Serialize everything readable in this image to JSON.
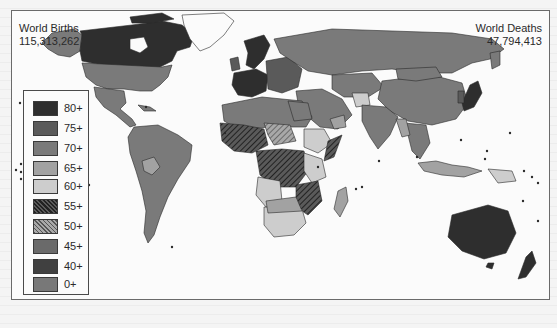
{
  "header": {
    "births": {
      "label": "World Births",
      "value": "115,313,262"
    },
    "deaths": {
      "label": "World Deaths",
      "value": "47,794,413"
    }
  },
  "legend": {
    "items": [
      {
        "label": "80+",
        "color": "#2e2e2e",
        "pattern": "solid"
      },
      {
        "label": "75+",
        "color": "#5a5a5a",
        "pattern": "solid"
      },
      {
        "label": "70+",
        "color": "#7a7a7a",
        "pattern": "solid"
      },
      {
        "label": "65+",
        "color": "#a2a2a2",
        "pattern": "solid"
      },
      {
        "label": "60+",
        "color": "#cdcdcd",
        "pattern": "solid"
      },
      {
        "label": "55+",
        "color": "#4a4a4a",
        "pattern": "hatch-dark"
      },
      {
        "label": "50+",
        "color": "#8a8a8a",
        "pattern": "hatch-light"
      },
      {
        "label": "45+",
        "color": "#6a6a6a",
        "pattern": "solid"
      },
      {
        "label": "40+",
        "color": "#404040",
        "pattern": "solid"
      },
      {
        "label": "0+",
        "color": "#787878",
        "pattern": "solid"
      }
    ]
  },
  "map": {
    "title": "World map shaded by life expectancy",
    "ocean_color": "#fbfbfb",
    "border_color": "#2a2a2a"
  }
}
